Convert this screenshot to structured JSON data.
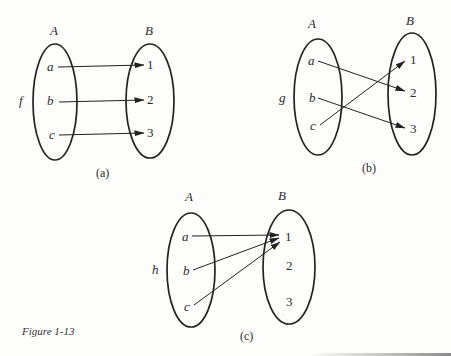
{
  "figure": {
    "caption": "Figure 1-13",
    "panels": [
      {
        "id": "a",
        "label": "(a)",
        "function_name": "f",
        "domain_label": "A",
        "codomain_label": "B",
        "domain": [
          "a",
          "b",
          "c"
        ],
        "codomain": [
          "1",
          "2",
          "3"
        ],
        "mapping": [
          [
            "a",
            "1"
          ],
          [
            "b",
            "2"
          ],
          [
            "c",
            "3"
          ]
        ]
      },
      {
        "id": "b",
        "label": "(b)",
        "function_name": "g",
        "domain_label": "A",
        "codomain_label": "B",
        "domain": [
          "a",
          "b",
          "c"
        ],
        "codomain": [
          "1",
          "2",
          "3"
        ],
        "mapping": [
          [
            "a",
            "2"
          ],
          [
            "b",
            "3"
          ],
          [
            "c",
            "1"
          ]
        ]
      },
      {
        "id": "c",
        "label": "(c)",
        "function_name": "h",
        "domain_label": "A",
        "codomain_label": "B",
        "domain": [
          "a",
          "b",
          "c"
        ],
        "codomain": [
          "1",
          "2",
          "3"
        ],
        "mapping": [
          [
            "a",
            "1"
          ],
          [
            "b",
            "1"
          ],
          [
            "c",
            "1"
          ]
        ]
      }
    ]
  },
  "colors": {
    "ink": "#222222",
    "paper": "#fdfdfc"
  }
}
